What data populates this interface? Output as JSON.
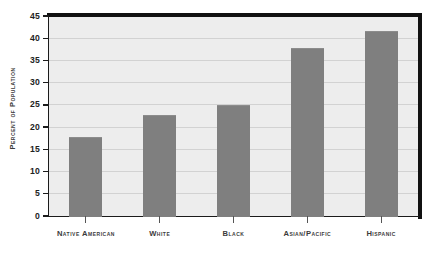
{
  "chart_data": {
    "type": "bar",
    "title": "",
    "subtitle": "",
    "xlabel": "",
    "ylabel": "Percent of Population",
    "categories": [
      "Native American",
      "White",
      "Black",
      "Asian/Pacific",
      "Hispanic"
    ],
    "values": [
      17.7,
      22.8,
      25.0,
      37.9,
      41.7
    ],
    "ylim": [
      0,
      45
    ],
    "ytick_values": [
      0,
      5,
      10,
      15,
      20,
      25,
      30,
      35,
      40,
      45
    ],
    "ytick_labels": [
      "0",
      "5",
      "10",
      "15",
      "20",
      "25",
      "30",
      "35",
      "40",
      "45"
    ],
    "grid": true,
    "legend": false,
    "colors": {
      "bar_fill": "#7f7f7f",
      "plot_background": "#ededed",
      "gridline": "#d2d2d2",
      "axis_line": "#1b1b1b",
      "frame_rule": "#111111",
      "label_text": "#3b3b3b",
      "tick_text": "#222222",
      "page_background": "#ffffff"
    }
  }
}
